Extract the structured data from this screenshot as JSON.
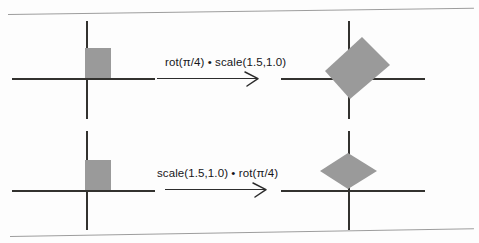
{
  "figure": {
    "gray_fill": "#9a9a9a",
    "axis_color": "#33322f",
    "rule_color": "#9d9d9d"
  },
  "rows": [
    {
      "id": "row-top",
      "operation_label": "rot(π/4) • scale(1.5,1.0)",
      "input_shape": "unit-square",
      "output_shape": "tilted-parallelogram",
      "source_square": {
        "x": 85,
        "y": 48,
        "width": 26,
        "height": 30
      },
      "source_origin": {
        "x": 86,
        "y": 78
      },
      "source_axis_h": {
        "x": 12,
        "y": 78,
        "length": 143
      },
      "source_axis_v": {
        "x": 86,
        "y": 21,
        "length": 98
      },
      "result_origin": {
        "x": 348,
        "y": 78
      },
      "result_axis_h": {
        "x": 281,
        "y": 78,
        "length": 144
      },
      "result_axis_v": {
        "x": 348,
        "y": 21,
        "length": 98
      },
      "result_points": "40,10 68,38 28,72 3,44",
      "result_box": {
        "x": 322,
        "y": 27,
        "width": 72,
        "height": 76
      },
      "arrow": {
        "x": 164,
        "y": 85,
        "length": 98
      },
      "label_pos": {
        "x": 165,
        "y": 61
      }
    },
    {
      "id": "row-bottom",
      "operation_label": "scale(1.5,1.0) • rot(π/4)",
      "input_shape": "unit-square",
      "output_shape": "stretched-diamond",
      "source_square": {
        "x": 85,
        "y": 160,
        "width": 26,
        "height": 30
      },
      "source_origin": {
        "x": 86,
        "y": 190
      },
      "source_axis_h": {
        "x": 12,
        "y": 190,
        "length": 143
      },
      "source_axis_v": {
        "x": 86,
        "y": 131,
        "length": 99
      },
      "result_origin": {
        "x": 348,
        "y": 190
      },
      "result_axis_h": {
        "x": 281,
        "y": 190,
        "length": 144
      },
      "result_axis_v": {
        "x": 348,
        "y": 131,
        "length": 99
      },
      "result_points": "29,1 58,19 29,37 1,19",
      "result_box": {
        "x": 319,
        "y": 152,
        "width": 60,
        "height": 39
      },
      "arrow": {
        "x": 164,
        "y": 196,
        "length": 98
      },
      "label_pos": {
        "x": 157,
        "y": 172
      }
    }
  ]
}
